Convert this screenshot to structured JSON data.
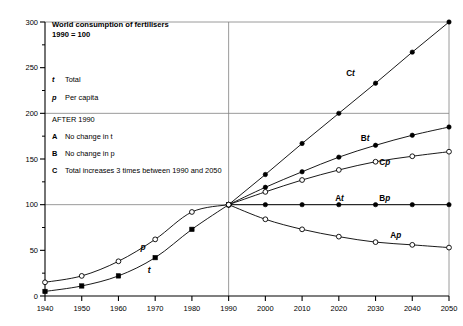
{
  "chart_data": {
    "type": "line",
    "title": "World consumption of fertilisers",
    "subtitle": "1990 = 100",
    "xlabel": "",
    "ylabel": "",
    "xlim": [
      1940,
      2050
    ],
    "ylim": [
      0,
      300
    ],
    "yticks": [
      0,
      50,
      100,
      150,
      200,
      250,
      300
    ],
    "ytick_labels": [
      "0",
      "50",
      "100",
      "150",
      "200",
      "250",
      "300"
    ],
    "yminor_step": 25,
    "xticks": [
      1940,
      1950,
      1960,
      1970,
      1980,
      1990,
      2000,
      2010,
      2020,
      2030,
      2040,
      2050
    ],
    "xtick_labels": [
      "1940",
      "1950",
      "1960",
      "1970",
      "1980",
      "1990",
      "2000",
      "2010",
      "2020",
      "2030",
      "2040",
      "2050"
    ],
    "gridlines_y": [
      100,
      200,
      300
    ],
    "gridlines_x": [
      1990
    ],
    "grid": true,
    "legend_position": "upper-left-inside",
    "series": [
      {
        "name": "t",
        "label": "Total",
        "marker": "filled-square",
        "x": [
          1940,
          1950,
          1960,
          1970,
          1980,
          1990
        ],
        "values": [
          5,
          11,
          22,
          42,
          73,
          100
        ]
      },
      {
        "name": "p",
        "label": "Per capita",
        "marker": "open-circle",
        "x": [
          1940,
          1950,
          1960,
          1970,
          1980,
          1990
        ],
        "values": [
          15,
          22,
          38,
          62,
          92,
          100
        ]
      },
      {
        "name": "Ct",
        "label": "Ct",
        "marker": "filled-circle",
        "x": [
          1990,
          2000,
          2010,
          2020,
          2030,
          2040,
          2050
        ],
        "values": [
          100,
          133,
          167,
          200,
          233,
          267,
          300
        ]
      },
      {
        "name": "Bt",
        "label": "Bt",
        "marker": "filled-circle",
        "x": [
          1990,
          2000,
          2010,
          2020,
          2030,
          2040,
          2050
        ],
        "values": [
          100,
          119,
          136,
          152,
          165,
          176,
          185
        ]
      },
      {
        "name": "Cp",
        "label": "Cp",
        "marker": "open-circle",
        "x": [
          1990,
          2000,
          2010,
          2020,
          2030,
          2040,
          2050
        ],
        "values": [
          100,
          114,
          127,
          138,
          147,
          153,
          158
        ]
      },
      {
        "name": "At_Bp",
        "label": "At / Bp",
        "marker": "filled-circle",
        "x": [
          1990,
          2000,
          2010,
          2020,
          2030,
          2040,
          2050
        ],
        "values": [
          100,
          100,
          100,
          100,
          100,
          100,
          100
        ]
      },
      {
        "name": "Ap",
        "label": "Ap",
        "marker": "open-circle",
        "x": [
          1990,
          2000,
          2010,
          2020,
          2030,
          2040,
          2050
        ],
        "values": [
          100,
          84,
          73,
          65,
          59,
          56,
          53
        ]
      }
    ],
    "annotations": [
      {
        "text": "Ct",
        "x": 2022,
        "y": 243
      },
      {
        "text": "Bt",
        "x": 2026,
        "y": 172
      },
      {
        "text": "Cp",
        "x": 2031,
        "y": 146
      },
      {
        "text": "At",
        "x": 2019,
        "y": 106
      },
      {
        "text": "Bp",
        "x": 2031,
        "y": 106
      },
      {
        "text": "Ap",
        "x": 2034,
        "y": 66
      },
      {
        "text": "p",
        "x": 1966,
        "y": 54
      },
      {
        "text": "t",
        "x": 1968,
        "y": 29
      }
    ]
  },
  "legend": {
    "keys": [
      {
        "symbol": "t",
        "text": "Total"
      },
      {
        "symbol": "p",
        "text": "Per capita"
      }
    ],
    "heading": "AFTER 1990",
    "scenarios": [
      {
        "symbol": "A",
        "text": "No change in t"
      },
      {
        "symbol": "B",
        "text": "No change in p"
      },
      {
        "symbol": "C",
        "text": "Total increases 3 times between 1990 and 2050"
      }
    ]
  },
  "colors": {
    "axis": "#000000",
    "grid": "#808080",
    "line": "#000000",
    "background": "#ffffff"
  }
}
